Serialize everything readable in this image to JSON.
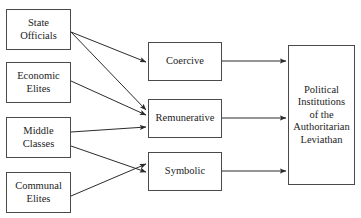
{
  "diagram": {
    "type": "flow-diagram",
    "canvas": {
      "width": 361,
      "height": 218
    },
    "colors": {
      "background": "#ffffff",
      "box_border": "#4a4a4a",
      "arrow": "#2b2b2b",
      "text": "#1c1c1c"
    },
    "sources": [
      {
        "id": "state-officials",
        "lines": [
          "State",
          "Officials"
        ],
        "x": 6,
        "y": 9,
        "w": 65,
        "h": 41
      },
      {
        "id": "economic-elites",
        "lines": [
          "Economic",
          "Elites"
        ],
        "x": 6,
        "y": 62,
        "w": 65,
        "h": 41
      },
      {
        "id": "middle-classes",
        "lines": [
          "Middle",
          "Classes"
        ],
        "x": 6,
        "y": 117,
        "w": 65,
        "h": 41
      },
      {
        "id": "communal-elites",
        "lines": [
          "Communal",
          "Elites"
        ],
        "x": 6,
        "y": 172,
        "w": 65,
        "h": 41
      }
    ],
    "mechanisms": [
      {
        "id": "coercive",
        "lines": [
          "Coercive"
        ],
        "x": 148,
        "y": 42,
        "w": 74,
        "h": 39
      },
      {
        "id": "remunerative",
        "lines": [
          "Remunerative"
        ],
        "x": 148,
        "y": 99,
        "w": 74,
        "h": 39
      },
      {
        "id": "symbolic",
        "lines": [
          "Symbolic"
        ],
        "x": 148,
        "y": 152,
        "w": 74,
        "h": 39
      }
    ],
    "sink": {
      "id": "political-institutions",
      "lines": [
        "Political",
        "Institutions",
        "of the",
        "Authoritarian",
        "Leviathan"
      ],
      "x": 288,
      "y": 45,
      "w": 67,
      "h": 140
    },
    "edges": [
      {
        "id": "state-officials-to-coercive",
        "from": "state-officials",
        "to": "coercive",
        "x1": 71,
        "y1": 32,
        "x2": 146,
        "y2": 62
      },
      {
        "id": "state-officials-to-remunerative",
        "from": "state-officials",
        "to": "remunerative",
        "x1": 71,
        "y1": 32,
        "x2": 146,
        "y2": 110
      },
      {
        "id": "economic-elites-to-remunerative",
        "from": "economic-elites",
        "to": "remunerative",
        "x1": 71,
        "y1": 81,
        "x2": 146,
        "y2": 115
      },
      {
        "id": "middle-classes-to-remunerative",
        "from": "middle-classes",
        "to": "remunerative",
        "x1": 71,
        "y1": 132,
        "x2": 146,
        "y2": 127
      },
      {
        "id": "middle-classes-to-symbolic",
        "from": "middle-classes",
        "to": "symbolic",
        "x1": 71,
        "y1": 146,
        "x2": 146,
        "y2": 172
      },
      {
        "id": "communal-elites-to-symbolic",
        "from": "communal-elites",
        "to": "symbolic",
        "x1": 71,
        "y1": 196,
        "x2": 146,
        "y2": 164
      },
      {
        "id": "coercive-to-institutions",
        "from": "coercive",
        "to": "political-institutions",
        "x1": 222,
        "y1": 61,
        "x2": 286,
        "y2": 61
      },
      {
        "id": "remunerative-to-institutions",
        "from": "remunerative",
        "to": "political-institutions",
        "x1": 222,
        "y1": 118,
        "x2": 286,
        "y2": 118
      },
      {
        "id": "symbolic-to-institutions",
        "from": "symbolic",
        "to": "political-institutions",
        "x1": 222,
        "y1": 171,
        "x2": 286,
        "y2": 171
      }
    ]
  }
}
